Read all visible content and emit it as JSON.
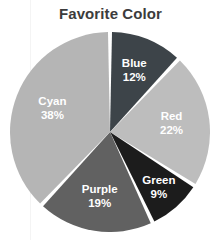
{
  "chart_title": "Favorite Color",
  "background_color": "#ffffff",
  "title_color": "#3c3c3c",
  "separator_color": "#ffffff",
  "label_color": "#ffffff",
  "chart_data": {
    "type": "pie",
    "title": "Favorite Color",
    "xlabel": "",
    "ylabel": "",
    "legend": "none",
    "grid": false,
    "start_angle_deg": 0,
    "direction": "clockwise",
    "units": "percent",
    "total": 100,
    "categories": [
      "Blue",
      "Red",
      "Green",
      "Purple",
      "Cyan"
    ],
    "values": [
      12,
      22,
      9,
      19,
      38
    ],
    "labels": [
      "Blue",
      "Red",
      "Green",
      "Purple",
      "Cyan"
    ],
    "value_labels": [
      "12%",
      "22%",
      "9%",
      "19%",
      "38%"
    ],
    "colors": [
      "#3d4449",
      "#bdbdbd",
      "#1c1c1c",
      "#616161",
      "#b5b5b5"
    ],
    "slices": [
      {
        "label": "Blue",
        "value": 12,
        "value_label": "12%",
        "color": "#3d4449"
      },
      {
        "label": "Red",
        "value": 22,
        "value_label": "22%",
        "color": "#bdbdbd"
      },
      {
        "label": "Green",
        "value": 9,
        "value_label": "9%",
        "color": "#1c1c1c"
      },
      {
        "label": "Purple",
        "value": 19,
        "value_label": "19%",
        "color": "#616161"
      },
      {
        "label": "Cyan",
        "value": 38,
        "value_label": "38%",
        "color": "#b5b5b5"
      }
    ]
  }
}
